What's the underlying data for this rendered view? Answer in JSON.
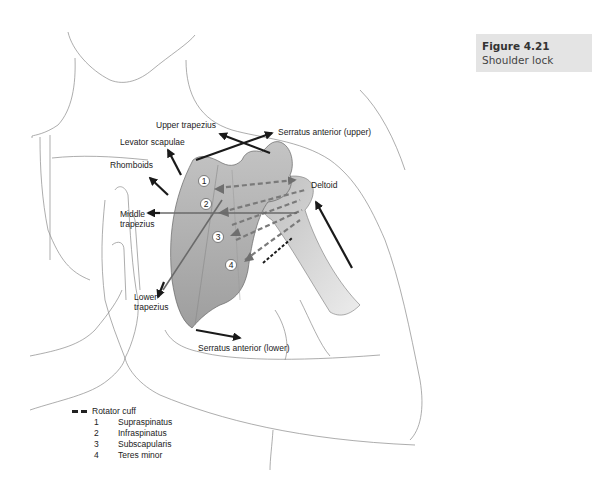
{
  "caption": {
    "figure_number": "Figure 4.21",
    "title": "Shoulder lock"
  },
  "labels": {
    "upper_trapezius": "Upper trapezius",
    "serratus_anterior_upper": "Serratus anterior (upper)",
    "levator_scapulae": "Levator scapulae",
    "rhomboids": "Rhomboids",
    "deltoid": "Deltoid",
    "middle_trapezius_1": "Middle",
    "middle_trapezius_2": "trapezius",
    "lower_trapezius_1": "Lower",
    "lower_trapezius_2": "trapezius",
    "serratus_anterior_lower": "Serratus anterior (lower)"
  },
  "markers": [
    "1",
    "2",
    "3",
    "4"
  ],
  "legend": {
    "title": "Rotator cuff",
    "items": [
      {
        "num": "1",
        "label": "Supraspinatus"
      },
      {
        "num": "2",
        "label": "Infraspinatus"
      },
      {
        "num": "3",
        "label": "Subscapularis"
      },
      {
        "num": "4",
        "label": "Teres minor"
      }
    ]
  },
  "colors": {
    "caption_bg": "#e4e4e4",
    "scapula_fill": "#b9b9b9",
    "arrow": "#1a1a1a",
    "rotator_dash": "#7a7a7a"
  }
}
